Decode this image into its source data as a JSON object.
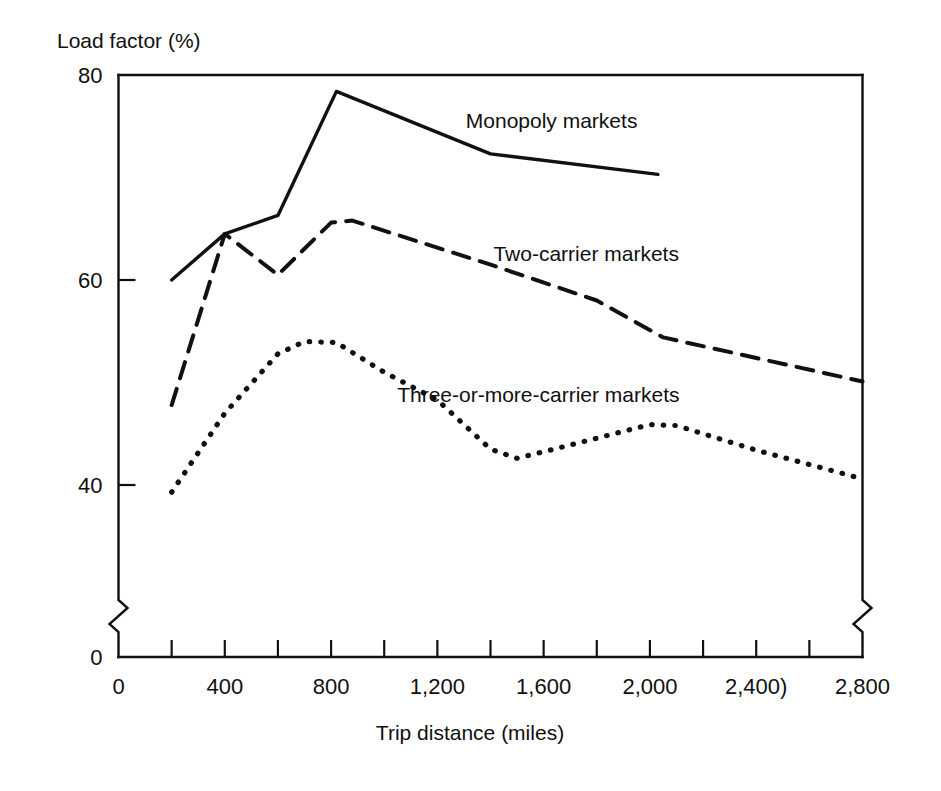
{
  "chart_data": {
    "type": "line",
    "title": "",
    "xlabel": "Trip distance (miles)",
    "ylabel": "Load factor (%)",
    "xlim": [
      0,
      2800
    ],
    "ylim": [
      0,
      80
    ],
    "y_axis_break": true,
    "y_break_note": "axis broken between 0 and approximately 33",
    "x_axis_break_right": true,
    "grid": false,
    "legend_position": "inline-annotations",
    "x_tick_values": [
      0,
      200,
      400,
      600,
      800,
      1000,
      1200,
      1400,
      1600,
      1800,
      2000,
      2200,
      2400,
      2600,
      2800
    ],
    "x_tick_labels_shown": [
      "0",
      "400",
      "800",
      "1,200",
      "1,600",
      "2,000",
      "2,400)",
      "2,800"
    ],
    "x_labeled_values": [
      0,
      400,
      800,
      1200,
      1600,
      2000,
      2400,
      2800
    ],
    "y_tick_labels_shown": [
      "80",
      "60",
      "40",
      "0"
    ],
    "y_labeled_values": [
      80,
      60,
      40,
      0
    ],
    "series": [
      {
        "name": "Monopoly markets",
        "style": "solid",
        "label": "Monopoly markets",
        "x": [
          200,
          400,
          600,
          820,
          1400,
          2030
        ],
        "values": [
          60.0,
          64.5,
          66.3,
          78.4,
          72.3,
          70.3
        ]
      },
      {
        "name": "Two-carrier markets",
        "style": "dashed",
        "label": "Two-carrier markets",
        "x": [
          200,
          400,
          600,
          800,
          880,
          1400,
          1800,
          2050,
          2800
        ],
        "values": [
          47.8,
          64.5,
          60.5,
          65.6,
          65.8,
          61.5,
          58.0,
          54.4,
          50.1
        ]
      },
      {
        "name": "Three-or-more-carrier markets",
        "style": "dotted",
        "label": "Three-or-more-carrier markets",
        "x": [
          200,
          400,
          600,
          700,
          820,
          1000,
          1200,
          1400,
          1500,
          1700,
          2000,
          2100,
          2400,
          2800
        ],
        "values": [
          39.3,
          47.0,
          52.8,
          54.0,
          53.9,
          51.0,
          48.3,
          43.5,
          42.6,
          43.9,
          45.9,
          45.8,
          43.4,
          40.6
        ]
      }
    ],
    "annotations": [
      {
        "text": "Monopoly markets",
        "anchor_x": 1630,
        "anchor_y": 75.5
      },
      {
        "text": "Two-carrier markets",
        "anchor_x": 1760,
        "anchor_y": 62.5
      },
      {
        "text": "Three-or-more-carrier markets",
        "anchor_x": 1580,
        "anchor_y": 48.8
      }
    ],
    "colors": {
      "line": "#111111",
      "text": "#101010",
      "background": "#ffffff"
    }
  }
}
